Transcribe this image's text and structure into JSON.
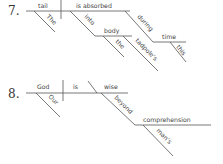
{
  "diagrams": [
    {
      "number": "7.",
      "subject": "tail",
      "verb": "is absorbed",
      "modifiers": {
        "subject_modifier": "The",
        "prep1": "into",
        "prep1_object": "body",
        "prep1_object_mods": [
          "the",
          "tadpole's"
        ],
        "prep2": "during",
        "prep2_object": "time",
        "prep2_object_mod": "this"
      }
    },
    {
      "number": "8.",
      "subject": "God",
      "verb": "is",
      "predicate_adjective": "wise",
      "modifiers": {
        "subject_modifier": "Our",
        "prep": "beyond",
        "prep_object": "comprehension",
        "prep_object_mod": "man's"
      }
    }
  ]
}
